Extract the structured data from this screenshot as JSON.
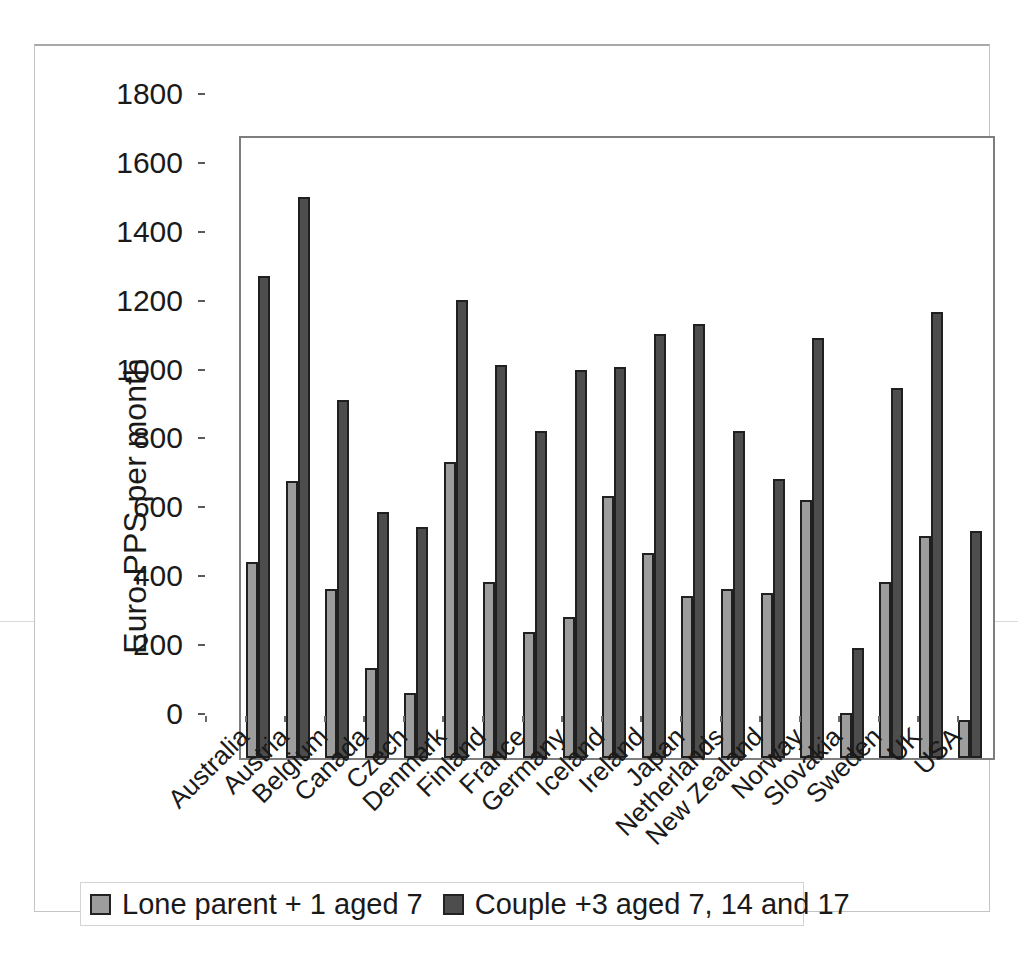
{
  "chart_data": {
    "type": "bar",
    "title": "",
    "xlabel": "",
    "ylabel": "Euro-PPS per month",
    "ylim": [
      0,
      1800
    ],
    "ytick_step": 200,
    "yticks": [
      "0",
      "200",
      "400",
      "600",
      "800",
      "1000",
      "1200",
      "1400",
      "1600",
      "1800"
    ],
    "grid": false,
    "legend_position": "bottom-left",
    "categories": [
      "Australia",
      "Austria",
      "Belgium",
      "Canada",
      "Czech",
      "Denmark",
      "Finland",
      "France",
      "Germany",
      "Iceland",
      "Ireland",
      "Japan",
      "Netherlands",
      "New Zealand",
      "Norway",
      "Slovakia",
      "Sweden",
      "UK",
      "USA"
    ],
    "series": [
      {
        "name": "Lone parent + 1 aged 7",
        "color": "#9d9d9d",
        "values": [
          570,
          805,
          490,
          260,
          190,
          860,
          510,
          365,
          410,
          760,
          595,
          470,
          490,
          480,
          750,
          130,
          510,
          645,
          110
        ]
      },
      {
        "name": "Couple +3 aged 7, 14 and 17",
        "color": "#4d4d4d",
        "values": [
          1400,
          1630,
          1040,
          715,
          670,
          1330,
          1140,
          950,
          1125,
          1135,
          1230,
          1260,
          950,
          810,
          1220,
          320,
          1075,
          1295,
          660
        ]
      }
    ]
  },
  "colors": {
    "bar_border": "#202020",
    "axis": "#5a5a5a",
    "plot_border": "#7e7e7e",
    "text": "#1a1a1a",
    "legend_border": "#d4d4d4",
    "scan_artifact": "#d9d9d9"
  }
}
